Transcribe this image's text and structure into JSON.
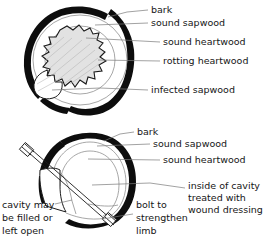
{
  "figure": {
    "background_color": "#ffffff",
    "ink_color": "#0d0d0d",
    "leader_color": "#7a7a7a",
    "ring_color": "#8a8a8a",
    "rot_fill_color": "#e2e2e2"
  },
  "top_diagram": {
    "name": "untreated-cavity-cross-section",
    "labels": [
      {
        "id": "bark",
        "text": "bark"
      },
      {
        "id": "sound-sapwood",
        "text": "sound sapwood"
      },
      {
        "id": "sound-heartwood",
        "text": "sound heartwood"
      },
      {
        "id": "rotting-heartwood",
        "text": "rotting heartwood"
      },
      {
        "id": "infected-sapwood",
        "text": "infected sapwood"
      }
    ]
  },
  "bottom_diagram": {
    "name": "treated-cavity-cross-section",
    "labels": [
      {
        "id": "bark",
        "text": "bark"
      },
      {
        "id": "sound-sapwood",
        "text": "sound sapwood"
      },
      {
        "id": "sound-heartwood",
        "text": "sound heartwood"
      },
      {
        "id": "inside-cavity-1",
        "text": "inside of cavity"
      },
      {
        "id": "inside-cavity-2",
        "text": "treated with"
      },
      {
        "id": "inside-cavity-3",
        "text": "wound dressing"
      },
      {
        "id": "cavity-open-1",
        "text": "cavity may"
      },
      {
        "id": "cavity-open-2",
        "text": "be filled or"
      },
      {
        "id": "cavity-open-3",
        "text": "left open"
      },
      {
        "id": "bolt-1",
        "text": "bolt to"
      },
      {
        "id": "bolt-2",
        "text": "strengthen"
      },
      {
        "id": "bolt-3",
        "text": "limb"
      }
    ]
  }
}
